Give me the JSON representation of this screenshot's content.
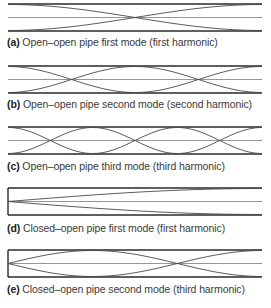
{
  "figure": {
    "pipe": {
      "x_start": 8,
      "x_end": 262,
      "half_height": 13.5
    },
    "colors": {
      "wall": "#2a2a2a",
      "axis": "#8a8a8a",
      "curve": "#4a4a4a",
      "caption": "#3a3a3a"
    },
    "panels": [
      {
        "id": "a",
        "letter": "(a)",
        "text": " Open–open pipe first mode (first harmonic)",
        "pipe_type": "open-open",
        "harmonic": 1,
        "top": 3,
        "caption_y": 36
      },
      {
        "id": "b",
        "letter": "(b)",
        "text": " Open–open pipe second mode (second harmonic)",
        "pipe_type": "open-open",
        "harmonic": 2,
        "top": 65,
        "caption_y": 98
      },
      {
        "id": "c",
        "letter": "(c)",
        "text": " Open–open pipe third mode (third harmonic)",
        "pipe_type": "open-open",
        "harmonic": 3,
        "top": 126,
        "caption_y": 160
      },
      {
        "id": "d",
        "letter": "(d)",
        "text": " Closed–open pipe first mode (first harmonic)",
        "pipe_type": "closed-open",
        "harmonic": 1,
        "top": 187,
        "caption_y": 222
      },
      {
        "id": "e",
        "letter": "(e)",
        "text": " Closed–open pipe second mode (third harmonic)",
        "pipe_type": "closed-open",
        "harmonic": 3,
        "top": 249,
        "caption_y": 283
      }
    ]
  }
}
